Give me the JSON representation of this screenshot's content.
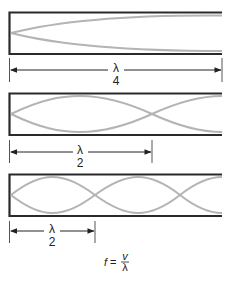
{
  "diagram": {
    "colors": {
      "tube": "#2a2a2a",
      "wave": "#b4b4b4",
      "dimension": "#222222"
    },
    "panels": [
      {
        "id": "panel-1",
        "description": "Closed at left end, open at right; fundamental mode",
        "dimension_label": {
          "numerator": "λ",
          "denominator": "4"
        }
      },
      {
        "id": "panel-2",
        "description": "Closed at left end; one node crossing",
        "dimension_label": {
          "numerator": "λ",
          "denominator": "2"
        }
      },
      {
        "id": "panel-3",
        "description": "Closed at left end; two node crossings",
        "dimension_label": {
          "numerator": "λ",
          "denominator": "2"
        }
      }
    ],
    "formula": {
      "lhs": "f",
      "equals": "=",
      "numerator": "v",
      "denominator": "λ"
    }
  }
}
